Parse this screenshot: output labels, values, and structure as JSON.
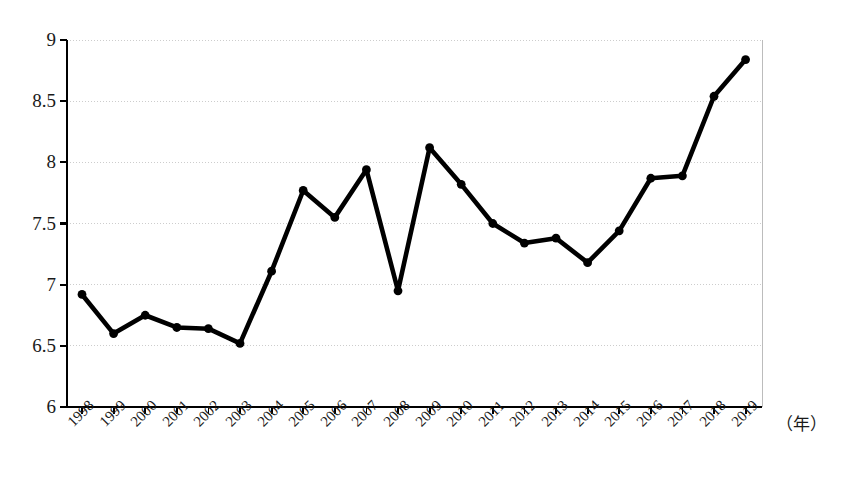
{
  "chart_data": {
    "type": "line",
    "title": "",
    "subtitle": "",
    "xlabel": "（年）",
    "ylabel": "",
    "xlim": [
      1998,
      2019
    ],
    "ylim": [
      6,
      9
    ],
    "grid": true,
    "legend": null,
    "y_ticks": [
      6,
      6.5,
      7,
      7.5,
      8,
      8.5,
      9
    ],
    "y_tick_labels": [
      "6",
      "6.5",
      "7",
      "7.5",
      "8",
      "8.5",
      "9"
    ],
    "categories": [
      "1998",
      "1999",
      "2000",
      "2001",
      "2002",
      "2003",
      "2004",
      "2005",
      "2006",
      "2007",
      "2008",
      "2009",
      "2010",
      "2011",
      "2012",
      "2013",
      "2014",
      "2015",
      "2016",
      "2017",
      "2018",
      "2019"
    ],
    "values": [
      6.92,
      6.6,
      6.75,
      6.65,
      6.64,
      6.52,
      7.11,
      7.77,
      7.55,
      7.94,
      6.95,
      8.12,
      7.82,
      7.5,
      7.34,
      7.38,
      7.18,
      7.44,
      7.87,
      7.89,
      8.54,
      8.84
    ],
    "marker": "circle",
    "line_color": "#000000",
    "marker_color": "#000000",
    "grid_color": "#c8c8c8",
    "axis_color": "#000000",
    "background_color": "#ffffff"
  }
}
